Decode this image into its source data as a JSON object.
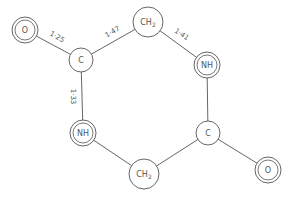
{
  "diagram": {
    "title": "",
    "atoms": [
      {
        "id": "O1",
        "label": "O",
        "double": true
      },
      {
        "id": "C1",
        "label": "C",
        "double": false
      },
      {
        "id": "CH2a",
        "label": "CH",
        "sub": "2",
        "double": false
      },
      {
        "id": "NH1",
        "label": "NH",
        "double": true
      },
      {
        "id": "C2",
        "label": "C",
        "double": false
      },
      {
        "id": "O2",
        "label": "O",
        "double": true
      },
      {
        "id": "CH2b",
        "label": "CH",
        "sub": "2",
        "double": false
      },
      {
        "id": "NH2",
        "label": "NH",
        "double": true
      }
    ],
    "bonds": [
      {
        "from": "O1",
        "to": "C1",
        "length_label": "1·25"
      },
      {
        "from": "C1",
        "to": "CH2a",
        "length_label": "1·47"
      },
      {
        "from": "CH2a",
        "to": "NH1",
        "length_label": "1·41"
      },
      {
        "from": "NH1",
        "to": "C2",
        "length_label": ""
      },
      {
        "from": "C2",
        "to": "O2",
        "length_label": ""
      },
      {
        "from": "C2",
        "to": "CH2b",
        "length_label": ""
      },
      {
        "from": "CH2b",
        "to": "NH2",
        "length_label": ""
      },
      {
        "from": "NH2",
        "to": "C1",
        "length_label": "1·33"
      }
    ]
  }
}
